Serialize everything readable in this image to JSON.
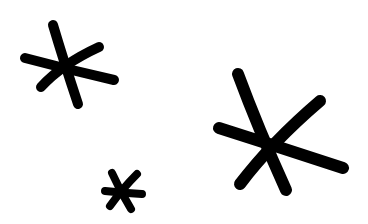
{
  "canvas": {
    "width": 368,
    "height": 224,
    "background": "#ffffff"
  },
  "ink_color": "#000000",
  "shapes": [
    {
      "name": "asterisk-large-topleft",
      "type": "asterisk",
      "arms": 6
    },
    {
      "name": "asterisk-large-right",
      "type": "asterisk",
      "arms": 6
    },
    {
      "name": "asterisk-small-bottom",
      "type": "asterisk",
      "arms": 6
    }
  ]
}
